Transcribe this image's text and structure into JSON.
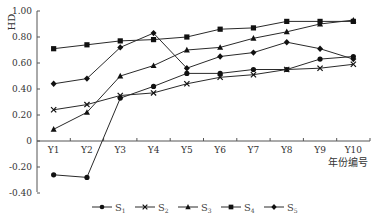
{
  "chart_data": {
    "type": "line",
    "title": "",
    "xlabel": "年份编号",
    "ylabel": "HD",
    "categories": [
      "Y1",
      "Y2",
      "Y3",
      "Y4",
      "Y5",
      "Y6",
      "Y7",
      "Y8",
      "Y9",
      "Y10"
    ],
    "ylim": [
      -0.4,
      1.0
    ],
    "yticks": [
      1.0,
      0.8,
      0.6,
      0.4,
      0.2,
      0,
      -0.2,
      -0.4
    ],
    "ytick_labels": [
      "1.00",
      "0.80",
      "0.60",
      "0.40",
      "0.20",
      "0",
      "-0.20",
      "-0.40"
    ],
    "grid": false,
    "legend_position": "bottom",
    "series": [
      {
        "name": "S1",
        "base": "S",
        "sub": "1",
        "marker": "circle",
        "values": [
          -0.26,
          -0.28,
          0.33,
          0.42,
          0.52,
          0.52,
          0.55,
          0.55,
          0.63,
          0.65
        ]
      },
      {
        "name": "S2",
        "base": "S",
        "sub": "2",
        "marker": "x",
        "values": [
          0.24,
          0.28,
          0.35,
          0.37,
          0.44,
          0.49,
          0.51,
          0.55,
          0.56,
          0.59
        ]
      },
      {
        "name": "S3",
        "base": "S",
        "sub": "3",
        "marker": "triangle",
        "values": [
          0.09,
          0.22,
          0.5,
          0.58,
          0.7,
          0.72,
          0.79,
          0.84,
          0.9,
          0.93
        ]
      },
      {
        "name": "S4",
        "base": "S",
        "sub": "4",
        "marker": "square",
        "values": [
          0.71,
          0.74,
          0.77,
          0.78,
          0.8,
          0.86,
          0.87,
          0.92,
          0.92,
          0.92
        ]
      },
      {
        "name": "S5",
        "base": "S",
        "sub": "5",
        "marker": "diamond",
        "values": [
          0.44,
          0.48,
          0.72,
          0.83,
          0.56,
          0.65,
          0.68,
          0.76,
          0.71,
          0.63
        ]
      }
    ]
  },
  "colors": {
    "line": "#2a2a2a",
    "axis": "#555555",
    "marker": "#111111"
  }
}
